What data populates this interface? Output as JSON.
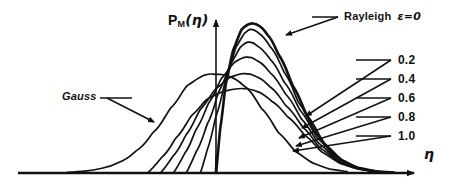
{
  "figure": {
    "background_color": "#ffffff",
    "ink_color": "#111111",
    "axis": {
      "y_label": "P",
      "y_label_sub": "M",
      "y_label_arg": "(η)",
      "x_label": "η",
      "origin_x": 216,
      "baseline_y": 173,
      "axis_top_y": 14,
      "axis_right_x": 420
    },
    "annotations": {
      "gauss_label": "Gauss",
      "rayleigh_label": "Rayleigh",
      "rayleigh_epsilon": "ε=0"
    },
    "epsilon_labels": [
      "0.2",
      "0.4",
      "0.6",
      "0.8",
      "1.0"
    ]
  },
  "chart_data": {
    "type": "line",
    "title": "",
    "xlabel": "η",
    "ylabel": "P_M(η)",
    "axis_arrows": true,
    "grid": false,
    "legend_position": "inline-leader-lines",
    "xlim": [
      -5.2,
      6.8
    ],
    "ylim": [
      0,
      1.05
    ],
    "series": [
      {
        "name": "Gauss",
        "label": "Gauss",
        "epsilon": null,
        "peak_x": -0.03,
        "peak_y": 0.66,
        "x": [
          -5.2,
          -4.6,
          -4.0,
          -3.4,
          -2.8,
          -2.2,
          -1.6,
          -1.0,
          -0.4,
          0.0,
          0.4,
          1.0,
          1.6,
          2.2,
          2.8,
          3.4,
          4.0,
          4.6
        ],
        "y": [
          0.005,
          0.013,
          0.032,
          0.072,
          0.148,
          0.272,
          0.432,
          0.586,
          0.655,
          0.66,
          0.65,
          0.58,
          0.43,
          0.268,
          0.142,
          0.066,
          0.026,
          0.009
        ]
      },
      {
        "name": "Rayleigh eps=0",
        "label": "Rayleigh ε=0",
        "epsilon": "0",
        "peak_x": 1.3,
        "peak_y": 1.0,
        "x": [
          0.0,
          0.15,
          0.35,
          0.6,
          0.9,
          1.15,
          1.3,
          1.5,
          1.8,
          2.2,
          2.7,
          3.2,
          3.8,
          4.4,
          5.0,
          5.6,
          6.2
        ],
        "y": [
          0.0,
          0.3,
          0.6,
          0.82,
          0.96,
          0.995,
          1.0,
          0.985,
          0.925,
          0.79,
          0.58,
          0.38,
          0.195,
          0.088,
          0.034,
          0.012,
          0.004
        ]
      },
      {
        "name": "eps=0.2",
        "label": "0.2",
        "epsilon": "0.2",
        "peak_x": 1.22,
        "peak_y": 0.96,
        "x": [
          -0.55,
          -0.3,
          0.0,
          0.35,
          0.7,
          1.0,
          1.22,
          1.5,
          1.9,
          2.4,
          2.9,
          3.5,
          4.1,
          4.7,
          5.3,
          5.9
        ],
        "y": [
          0.0,
          0.16,
          0.38,
          0.63,
          0.84,
          0.935,
          0.96,
          0.935,
          0.845,
          0.67,
          0.47,
          0.265,
          0.125,
          0.05,
          0.017,
          0.005
        ]
      },
      {
        "name": "eps=0.4",
        "label": "0.4",
        "epsilon": "0.4",
        "peak_x": 1.12,
        "peak_y": 0.875,
        "x": [
          -1.05,
          -0.7,
          -0.3,
          0.1,
          0.5,
          0.85,
          1.12,
          1.45,
          1.9,
          2.4,
          2.95,
          3.55,
          4.2,
          4.8,
          5.4,
          6.0
        ],
        "y": [
          0.0,
          0.14,
          0.33,
          0.545,
          0.725,
          0.84,
          0.875,
          0.85,
          0.76,
          0.605,
          0.42,
          0.235,
          0.108,
          0.042,
          0.015,
          0.004
        ]
      },
      {
        "name": "eps=0.6",
        "label": "0.6",
        "epsilon": "0.6",
        "peak_x": 1.05,
        "peak_y": 0.775,
        "x": [
          -1.5,
          -1.1,
          -0.7,
          -0.25,
          0.2,
          0.65,
          1.05,
          1.45,
          1.9,
          2.45,
          3.0,
          3.6,
          4.25,
          4.9,
          5.5,
          6.1
        ],
        "y": [
          0.0,
          0.13,
          0.29,
          0.47,
          0.635,
          0.74,
          0.775,
          0.75,
          0.67,
          0.525,
          0.36,
          0.2,
          0.09,
          0.035,
          0.012,
          0.003
        ]
      },
      {
        "name": "eps=0.8",
        "label": "0.8",
        "epsilon": "0.8",
        "peak_x": 0.95,
        "peak_y": 0.665,
        "x": [
          -1.95,
          -1.5,
          -1.05,
          -0.55,
          0.0,
          0.5,
          0.95,
          1.4,
          1.9,
          2.45,
          3.05,
          3.65,
          4.3,
          4.95,
          5.6,
          6.2
        ],
        "y": [
          0.0,
          0.115,
          0.255,
          0.425,
          0.565,
          0.64,
          0.665,
          0.645,
          0.575,
          0.45,
          0.305,
          0.168,
          0.076,
          0.029,
          0.01,
          0.003
        ]
      },
      {
        "name": "eps=1.0",
        "label": "1.0",
        "epsilon": "1.0",
        "peak_x": 0.88,
        "peak_y": 0.565,
        "x": [
          -2.4,
          -1.9,
          -1.4,
          -0.85,
          -0.3,
          0.3,
          0.88,
          1.4,
          1.95,
          2.5,
          3.1,
          3.7,
          4.35,
          5.0,
          5.65,
          6.3
        ],
        "y": [
          0.0,
          0.105,
          0.235,
          0.385,
          0.495,
          0.548,
          0.565,
          0.548,
          0.48,
          0.378,
          0.255,
          0.142,
          0.064,
          0.025,
          0.009,
          0.002
        ]
      }
    ],
    "leader_lines": [
      {
        "label": "Rayleigh ε=0",
        "from": [
          338,
          17
        ],
        "to": [
          286,
          35
        ],
        "arrow": true
      },
      {
        "label": "Gauss",
        "from": [
          107,
          98
        ],
        "to": [
          154,
          122
        ],
        "arrow": true
      },
      {
        "label": "0.2",
        "from": [
          391,
          60
        ],
        "to": [
          306,
          116
        ],
        "arrow": true
      },
      {
        "label": "0.4",
        "from": [
          391,
          79
        ],
        "to": [
          302,
          128
        ],
        "arrow": true
      },
      {
        "label": "0.6",
        "from": [
          391,
          98
        ],
        "to": [
          299,
          138
        ],
        "arrow": true
      },
      {
        "label": "0.8",
        "from": [
          391,
          117
        ],
        "to": [
          296,
          146
        ],
        "arrow": true
      },
      {
        "label": "1.0",
        "from": [
          391,
          136
        ],
        "to": [
          293,
          151
        ],
        "arrow": true
      }
    ]
  }
}
